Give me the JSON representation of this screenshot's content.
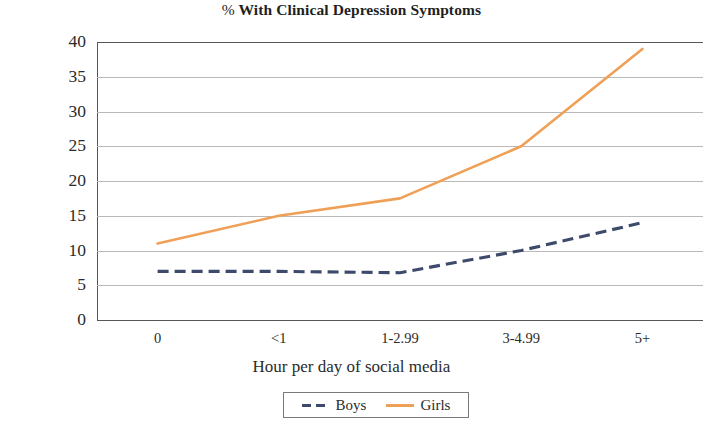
{
  "chart_data": {
    "type": "line",
    "title": "% With Clinical Depression Symptoms",
    "title_prefix": "%",
    "title_rest": " With Clinical Depression Symptoms",
    "xlabel": "Hour per day of social media",
    "ylabel": "",
    "categories": [
      "0",
      "<1",
      "1-2.99",
      "3-4.99",
      "5+"
    ],
    "ylim": [
      0,
      40
    ],
    "yticks": [
      "0",
      "5",
      "10",
      "15",
      "20",
      "25",
      "30",
      "35",
      "40"
    ],
    "ytick_values": [
      0,
      5,
      10,
      15,
      20,
      25,
      30,
      35,
      40
    ],
    "grid": true,
    "grid_axis": "y",
    "legend_position": "bottom",
    "series": [
      {
        "name": "Boys",
        "values": [
          7,
          7,
          6.8,
          10,
          14
        ],
        "color": "#3d4a6b",
        "style": "dashed"
      },
      {
        "name": "Girls",
        "values": [
          11,
          15,
          17.5,
          25,
          39
        ],
        "color": "#efa056",
        "style": "solid"
      }
    ]
  },
  "legend": {
    "items": [
      {
        "label": "Boys",
        "swatch": "dashed-line-swatch"
      },
      {
        "label": "Girls",
        "swatch": "solid-line-swatch"
      }
    ]
  }
}
